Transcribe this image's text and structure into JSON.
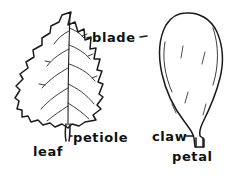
{
  "figure": {
    "background_color": "#ffffff",
    "ink_color": "#1a1a1a",
    "width": 237,
    "height": 181
  },
  "labels": {
    "blade": "blade",
    "petiole": "petiole",
    "leaf": "leaf",
    "claw": "claw",
    "petal": "petal"
  },
  "leader_marks": {
    "blade_left": "-",
    "blade_right": "-",
    "petiole_left": "...",
    "claw_right": "..."
  },
  "specimens": [
    {
      "name": "leaf",
      "label": "leaf",
      "parts": [
        "blade",
        "petiole"
      ],
      "margin": "serrate-lobed",
      "venation": "pinnate"
    },
    {
      "name": "petal",
      "label": "petal",
      "parts": [
        "blade",
        "claw"
      ],
      "shape": "spatulate"
    }
  ]
}
